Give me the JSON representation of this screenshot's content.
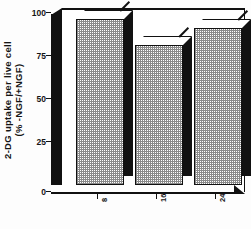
{
  "chart_data": {
    "type": "bar",
    "title": "",
    "subtitle": "",
    "xlabel": "",
    "ylabel": "2-DG uptake per live cell (% -NGF/+NGF)",
    "ylabel_line1": "2-DG uptake per live cell",
    "ylabel_line2": "(% -NGF/+NGF)",
    "categories": [
      "8",
      "16",
      "24"
    ],
    "values": [
      94,
      79,
      89
    ],
    "ylim": [
      0,
      100
    ],
    "yticks": [
      0,
      25,
      50,
      75,
      100
    ],
    "ytick_labels": [
      "0",
      "25",
      "50",
      "75",
      "100"
    ],
    "xtick_labels": [
      "8",
      "16",
      "24"
    ],
    "grid": false,
    "legend": null,
    "style": "3d-bar",
    "bar_fill": "checkered-dot-pattern",
    "series": [
      {
        "name": "2-DG uptake",
        "values": [
          94,
          79,
          89
        ]
      }
    ],
    "colors": {
      "axis": "#111111",
      "bar_face": "#ffffff",
      "bar_pattern": "#8a8a8a",
      "bar_side": "#111111",
      "background": "#ffffff"
    }
  },
  "caption": ""
}
